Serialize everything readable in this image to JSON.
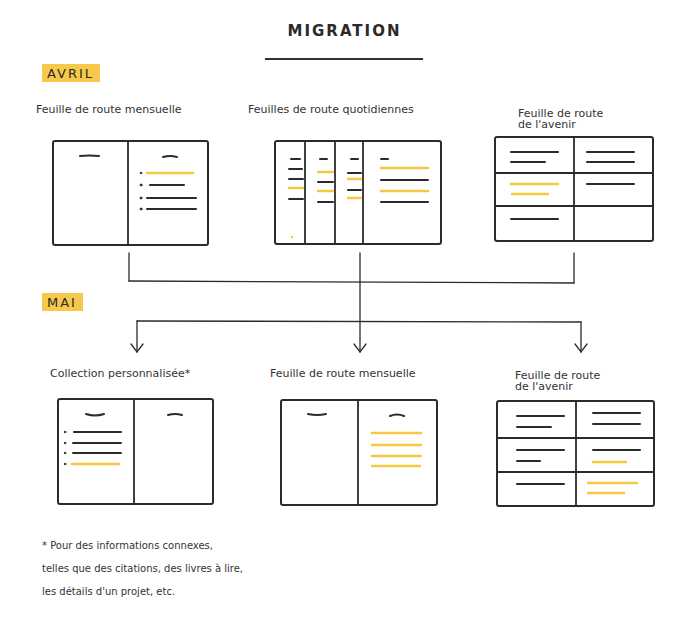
{
  "title": "MIGRATION",
  "months": {
    "april": {
      "label": "AVRIL",
      "color": "#f7c94a"
    },
    "may": {
      "label": "MAI",
      "color": "#f7c94a"
    }
  },
  "april": {
    "items": [
      {
        "label": "Feuille de route mensuelle"
      },
      {
        "label": "Feuilles de route quotidiennes"
      },
      {
        "label_line1": "Feuille de route",
        "label_line2": "de l'avenir"
      }
    ]
  },
  "may": {
    "items": [
      {
        "label": "Collection personnalisée*"
      },
      {
        "label": "Feuille de route mensuelle"
      },
      {
        "label_line1": "Feuille de route",
        "label_line2": "de l'avenir"
      }
    ]
  },
  "footnote": {
    "line1": "* Pour des informations connexes,",
    "line2": "telles que des citations, des livres à lire,",
    "line3": "les détails d'un projet, etc."
  },
  "colors": {
    "ink": "#2b2b2b",
    "highlight": "#f5c842"
  }
}
